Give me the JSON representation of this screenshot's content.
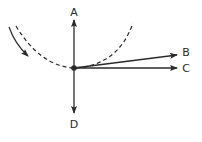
{
  "diagram": {
    "type": "circular-motion-tangent-vectors",
    "colors": {
      "stroke": "#2a2a2a",
      "background": "#ffffff"
    },
    "labels": {
      "a": "A",
      "b": "B",
      "c": "C",
      "d": "D"
    },
    "elements": {
      "path": "dashed circular arc",
      "motion_direction": "solid curved arrow (clockwise along arc)",
      "point": "object at bottom of arc",
      "arrows": [
        {
          "label": "A",
          "direction": "up"
        },
        {
          "label": "B",
          "direction": "right, slightly upward"
        },
        {
          "label": "C",
          "direction": "right (horizontal)"
        },
        {
          "label": "D",
          "direction": "down"
        }
      ]
    }
  }
}
